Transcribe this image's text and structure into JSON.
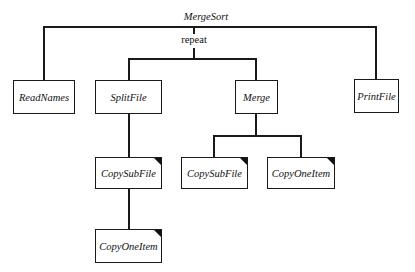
{
  "diagram": {
    "type": "structure-chart",
    "root": {
      "label": "MergeSort",
      "children": [
        "ReadNames",
        "repeat",
        "PrintFile"
      ]
    },
    "iteration_label": "repeat",
    "nodes": {
      "read_names": {
        "label": "ReadNames",
        "marked": false
      },
      "split_file": {
        "label": "SplitFile",
        "marked": false
      },
      "merge": {
        "label": "Merge",
        "marked": false
      },
      "print_file": {
        "label": "PrintFile",
        "marked": false
      },
      "copy_sub_file_1": {
        "label": "CopySubFile",
        "marked": true
      },
      "copy_one_item_1": {
        "label": "CopyOneItem",
        "marked": true
      },
      "copy_sub_file_2": {
        "label": "CopySubFile",
        "marked": true
      },
      "copy_one_item_2": {
        "label": "CopyOneItem",
        "marked": true
      }
    },
    "edges": [
      [
        "MergeSort",
        "ReadNames"
      ],
      [
        "MergeSort",
        "repeat"
      ],
      [
        "MergeSort",
        "PrintFile"
      ],
      [
        "repeat",
        "SplitFile"
      ],
      [
        "repeat",
        "Merge"
      ],
      [
        "SplitFile",
        "CopySubFile"
      ],
      [
        "CopySubFile",
        "CopyOneItem"
      ],
      [
        "Merge",
        "CopySubFile"
      ],
      [
        "Merge",
        "CopyOneItem"
      ]
    ]
  }
}
